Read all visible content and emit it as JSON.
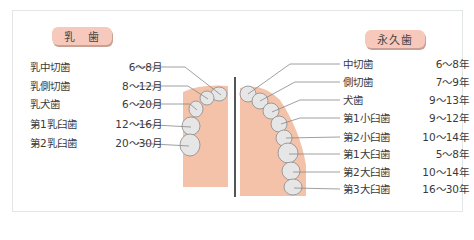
{
  "diagram": {
    "colors": {
      "badge_fill": "#f6c9bc",
      "gum": "#f3c2a8",
      "tooth": "#e4e4e4",
      "leader_line": "#777777",
      "divider": "#555555",
      "frame_border": "#e2e6e6"
    },
    "primary": {
      "title": "乳　歯",
      "teeth": [
        {
          "name": "乳中切歯",
          "age": "6〜8月"
        },
        {
          "name": "乳側切歯",
          "age": "8〜12月"
        },
        {
          "name": "乳犬歯",
          "age": "6〜20月"
        },
        {
          "name": "第1乳臼歯",
          "age": "12〜16月"
        },
        {
          "name": "第2乳臼歯",
          "age": "20〜30月"
        }
      ]
    },
    "permanent": {
      "title": "永久歯",
      "teeth": [
        {
          "name": "中切歯",
          "age": "6〜8年"
        },
        {
          "name": "側切歯",
          "age": "7〜9年"
        },
        {
          "name": "犬歯",
          "age": "9〜13年"
        },
        {
          "name": "第1小臼歯",
          "age": "9〜12年"
        },
        {
          "name": "第2小臼歯",
          "age": "10〜14年"
        },
        {
          "name": "第1大臼歯",
          "age": "5〜8年"
        },
        {
          "name": "第2大臼歯",
          "age": "10〜14年"
        },
        {
          "name": "第3大臼歯",
          "age": "16〜30年"
        }
      ]
    }
  }
}
